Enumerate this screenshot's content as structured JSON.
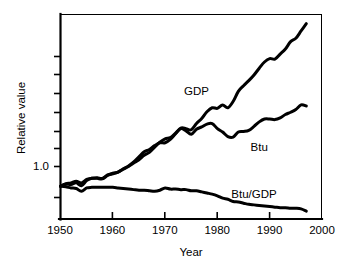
{
  "chart_data": {
    "type": "line",
    "title": "",
    "xlabel": "Year",
    "ylabel": "Relative value",
    "xlim": [
      1950,
      2000
    ],
    "ylim": [
      0.42,
      4.05
    ],
    "grid": false,
    "legend": "inline-labels",
    "x_ticks": [
      "1950",
      "1960",
      "1970",
      "1980",
      "1990",
      "2000"
    ],
    "x_tick_values": [
      1950,
      1960,
      1970,
      1980,
      1990,
      2000
    ],
    "y_ticks": [
      "",
      "",
      "",
      "",
      "",
      "",
      "1.0",
      ""
    ],
    "y_tick_labeled": [
      "1.0"
    ],
    "y_tick_values": [
      3.7,
      3.2,
      2.7,
      2.25,
      1.85,
      1.45,
      1.0,
      0.62
    ],
    "series": [
      {
        "name": "GDP",
        "label": "GDP",
        "color": "#000000",
        "label_x": 1976,
        "label_y": 2.62,
        "x": [
          1950,
          1951,
          1952,
          1953,
          1954,
          1955,
          1956,
          1957,
          1958,
          1959,
          1960,
          1961,
          1962,
          1963,
          1964,
          1965,
          1966,
          1967,
          1968,
          1969,
          1970,
          1971,
          1972,
          1973,
          1974,
          1975,
          1976,
          1977,
          1978,
          1979,
          1980,
          1981,
          1982,
          1983,
          1984,
          1985,
          1986,
          1987,
          1988,
          1989,
          1990,
          1991,
          1992,
          1993,
          1994,
          1995,
          1996,
          1997
        ],
        "values": [
          1.0,
          1.04,
          1.06,
          1.09,
          1.06,
          1.12,
          1.14,
          1.15,
          1.14,
          1.2,
          1.22,
          1.25,
          1.31,
          1.36,
          1.43,
          1.52,
          1.61,
          1.65,
          1.72,
          1.77,
          1.77,
          1.83,
          1.93,
          2.03,
          2.02,
          2.0,
          2.11,
          2.2,
          2.32,
          2.39,
          2.38,
          2.44,
          2.39,
          2.5,
          2.68,
          2.78,
          2.87,
          2.97,
          3.09,
          3.2,
          3.26,
          3.25,
          3.34,
          3.43,
          3.56,
          3.62,
          3.75,
          3.88
        ],
        "end_value": 3.88
      },
      {
        "name": "Btu",
        "label": "Btu",
        "color": "#000000",
        "label_x": 1988,
        "label_y": 1.62,
        "x": [
          1950,
          1951,
          1952,
          1953,
          1954,
          1955,
          1956,
          1957,
          1958,
          1959,
          1960,
          1961,
          1962,
          1963,
          1964,
          1965,
          1966,
          1967,
          1968,
          1969,
          1970,
          1971,
          1972,
          1973,
          1974,
          1975,
          1976,
          1977,
          1978,
          1979,
          1980,
          1981,
          1982,
          1983,
          1984,
          1985,
          1986,
          1987,
          1988,
          1989,
          1990,
          1991,
          1992,
          1993,
          1994,
          1995,
          1996,
          1997
        ],
        "values": [
          1.0,
          1.04,
          1.03,
          1.06,
          1.01,
          1.1,
          1.14,
          1.14,
          1.13,
          1.19,
          1.23,
          1.25,
          1.3,
          1.35,
          1.41,
          1.47,
          1.55,
          1.6,
          1.69,
          1.78,
          1.84,
          1.86,
          1.94,
          2.02,
          1.98,
          1.92,
          2.01,
          2.05,
          2.1,
          2.11,
          2.02,
          1.96,
          1.88,
          1.87,
          1.96,
          1.97,
          1.99,
          2.06,
          2.14,
          2.19,
          2.19,
          2.18,
          2.21,
          2.27,
          2.31,
          2.36,
          2.44,
          2.42
        ],
        "end_value": 2.42
      },
      {
        "name": "Btu/GDP",
        "label": "Btu/GDP",
        "color": "#000000",
        "label_x": 1987,
        "label_y": 0.8,
        "x": [
          1950,
          1951,
          1952,
          1953,
          1954,
          1955,
          1956,
          1957,
          1958,
          1959,
          1960,
          1961,
          1962,
          1963,
          1964,
          1965,
          1966,
          1967,
          1968,
          1969,
          1970,
          1971,
          1972,
          1973,
          1974,
          1975,
          1976,
          1977,
          1978,
          1979,
          1980,
          1981,
          1982,
          1983,
          1984,
          1985,
          1986,
          1987,
          1988,
          1989,
          1990,
          1991,
          1992,
          1993,
          1994,
          1995,
          1996,
          1997
        ],
        "values": [
          1.0,
          0.99,
          0.97,
          0.96,
          0.91,
          0.97,
          0.98,
          0.98,
          0.98,
          0.98,
          0.98,
          0.97,
          0.96,
          0.95,
          0.94,
          0.93,
          0.93,
          0.92,
          0.91,
          0.93,
          0.97,
          0.95,
          0.95,
          0.94,
          0.94,
          0.92,
          0.92,
          0.9,
          0.88,
          0.86,
          0.83,
          0.79,
          0.77,
          0.73,
          0.72,
          0.7,
          0.68,
          0.67,
          0.66,
          0.65,
          0.64,
          0.63,
          0.62,
          0.62,
          0.61,
          0.61,
          0.6,
          0.56
        ],
        "end_value": 0.56
      }
    ],
    "annotations": [
      {
        "text": "GDP",
        "x": 1976,
        "y": 2.62
      },
      {
        "text": "Btu",
        "x": 1988,
        "y": 1.62
      },
      {
        "text": "Btu/GDP",
        "x": 1987,
        "y": 0.8
      }
    ]
  }
}
